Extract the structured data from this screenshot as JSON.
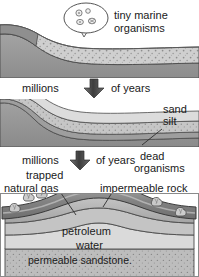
{
  "diagram": {
    "type": "geological-cross-section-sequence",
    "stages": [
      {
        "id": "stage-1",
        "order": 1,
        "description": "Seabed with tiny marine organisms settling in sediment",
        "callout": {
          "name": "tiny-marine-organisms-callout",
          "line1": "tiny marine",
          "line2": "organisms",
          "full_text": "tiny marine organisms",
          "bubble_shape": "rounded-speech-balloon-with-pointer",
          "organism_count": 4
        },
        "layers": [
          {
            "name": "water",
            "fill": "#ffffff"
          },
          {
            "name": "seabed-sediment",
            "fill": "#c9c9c9",
            "texture": "speckled-dots"
          },
          {
            "name": "bedrock",
            "fill": "#9b9b9b"
          }
        ]
      },
      {
        "id": "stage-2",
        "order": 2,
        "description": "Sand and silt layers bury the dead organisms",
        "labels": [
          {
            "name": "sand-label",
            "text": "sand"
          },
          {
            "name": "silt-label",
            "text": "silt"
          },
          {
            "name": "dead-organisms-label",
            "line1": "dead",
            "line2": "organisms",
            "full_text": "dead organisms"
          }
        ],
        "layers": [
          {
            "name": "sand",
            "fill": "#d6d6d6"
          },
          {
            "name": "silt",
            "fill": "#bdbdbd",
            "texture": "fine-speckle"
          },
          {
            "name": "dead-organisms",
            "fill": "#a8a8a8"
          },
          {
            "name": "bedrock",
            "fill": "#9b9b9b"
          }
        ]
      },
      {
        "id": "stage-3",
        "order": 3,
        "description": "Anticline trap with natural gas, petroleum, water and permeable sandstone",
        "labels": [
          {
            "name": "trapped-natural-gas-label",
            "line1": "trapped",
            "line2": "natural gas",
            "full_text": "trapped natural gas"
          },
          {
            "name": "impermeable-rock-label",
            "text": "impermeable rock"
          },
          {
            "name": "petroleum-label",
            "text": "petroleum"
          },
          {
            "name": "water-label",
            "text": "water"
          },
          {
            "name": "permeable-sandstone-label",
            "text": "permeable sandstone."
          }
        ],
        "layers": [
          {
            "name": "impermeable-rock",
            "fill": "#8c8c8c"
          },
          {
            "name": "gas-cap",
            "fill": "#b3b3b3"
          },
          {
            "name": "petroleum",
            "fill": "#c2c2c2"
          },
          {
            "name": "water",
            "fill": "#d9d9d9"
          },
          {
            "name": "permeable-sandstone",
            "fill": "#b5b5b5",
            "texture": "speckled-dots"
          }
        ],
        "gas_bubbles": 6
      }
    ],
    "transitions": [
      {
        "name": "time-arrow-1",
        "left_text": "millions",
        "right_text": "of years",
        "full_text": "millions of years",
        "direction": "down"
      },
      {
        "name": "time-arrow-2",
        "left_text": "millions",
        "right_text": "of years",
        "full_text": "millions of years",
        "direction": "down"
      }
    ],
    "colors": {
      "ink": "#1a1a1a",
      "outline": "#3a3a3a",
      "light_gray": "#d8d8d8",
      "mid_gray": "#b8b8b8",
      "dark_gray": "#909090",
      "darkest_gray": "#7a7a7a"
    }
  }
}
